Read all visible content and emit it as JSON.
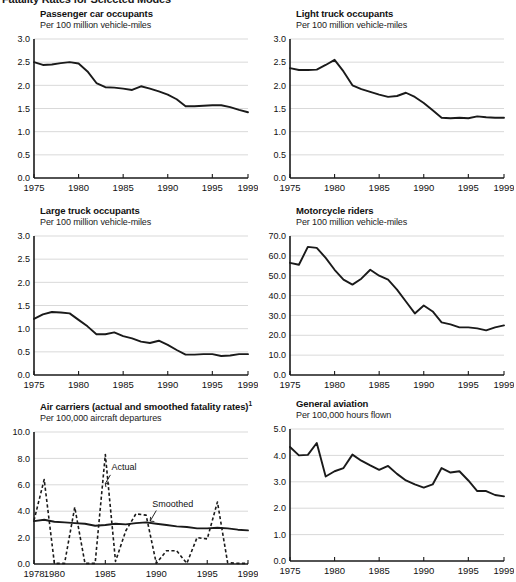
{
  "page": {
    "title": "Fatality Rates for Selected Modes"
  },
  "panels": [
    {
      "name": "passenger-car-occupants",
      "title": "Passenger car occupants",
      "subtitle": "Per 100 million vehicle-miles"
    },
    {
      "name": "light-truck-occupants",
      "title": "Light truck occupants",
      "subtitle": "Per 100 million vehicle-miles"
    },
    {
      "name": "large-truck-occupants",
      "title": "Large truck occupants",
      "subtitle": "Per 100 million vehicle-miles"
    },
    {
      "name": "motorcycle-riders",
      "title": "Motorcycle riders",
      "subtitle": "Per 100 million vehicle-miles"
    },
    {
      "name": "air-carriers",
      "title": "Air carriers (actual and smoothed fatality rates)",
      "title_sup": "1",
      "subtitle": "Per 100,000 aircraft departures"
    },
    {
      "name": "general-aviation",
      "title": "General aviation",
      "subtitle": "Per 100,000 hours flown"
    }
  ],
  "chart_data": [
    {
      "type": "line",
      "panel": "passenger-car-occupants",
      "title": "Passenger car occupants",
      "subtitle": "Per 100 million vehicle-miles",
      "xlabel": "",
      "ylabel": "Per 100 million vehicle-miles",
      "grid": true,
      "legend": "none",
      "xlim": [
        1975,
        1999
      ],
      "ylim": [
        0.0,
        3.0
      ],
      "yticks": [
        0.0,
        0.5,
        1.0,
        1.5,
        2.0,
        2.5,
        3.0
      ],
      "yticklabels": [
        "0.0",
        "0.5",
        "1.0",
        "1.5",
        "2.0",
        "2.5",
        "3.0"
      ],
      "xticks": [
        1975,
        1980,
        1985,
        1990,
        1995,
        1999
      ],
      "xticklabels": [
        "1975",
        "1980",
        "1985",
        "1990",
        "1995",
        "1999"
      ],
      "x": [
        1975,
        1976,
        1977,
        1978,
        1979,
        1980,
        1981,
        1982,
        1983,
        1984,
        1985,
        1986,
        1987,
        1988,
        1989,
        1990,
        1991,
        1992,
        1993,
        1994,
        1995,
        1996,
        1997,
        1998,
        1999
      ],
      "values": [
        2.5,
        2.44,
        2.45,
        2.48,
        2.5,
        2.47,
        2.3,
        2.05,
        1.96,
        1.95,
        1.93,
        1.9,
        1.98,
        1.93,
        1.87,
        1.8,
        1.7,
        1.55,
        1.55,
        1.56,
        1.57,
        1.57,
        1.53,
        1.47,
        1.42
      ]
    },
    {
      "type": "line",
      "panel": "light-truck-occupants",
      "title": "Light truck occupants",
      "subtitle": "Per 100 million vehicle-miles",
      "xlabel": "",
      "ylabel": "Per 100 million vehicle-miles",
      "grid": true,
      "legend": "none",
      "xlim": [
        1975,
        1999
      ],
      "ylim": [
        0.0,
        3.0
      ],
      "yticks": [
        0.0,
        0.5,
        1.0,
        1.5,
        2.0,
        2.5,
        3.0
      ],
      "yticklabels": [
        "0.0",
        "0.5",
        "1.0",
        "1.5",
        "2.0",
        "2.5",
        "3.0"
      ],
      "xticks": [
        1975,
        1980,
        1985,
        1990,
        1995,
        1999
      ],
      "xticklabels": [
        "1975",
        "1980",
        "1985",
        "1990",
        "1995",
        "1999"
      ],
      "x": [
        1975,
        1976,
        1977,
        1978,
        1979,
        1980,
        1981,
        1982,
        1983,
        1984,
        1985,
        1986,
        1987,
        1988,
        1989,
        1990,
        1991,
        1992,
        1993,
        1994,
        1995,
        1996,
        1997,
        1998,
        1999
      ],
      "values": [
        2.37,
        2.33,
        2.33,
        2.34,
        2.44,
        2.55,
        2.3,
        2.0,
        1.92,
        1.86,
        1.8,
        1.75,
        1.77,
        1.84,
        1.75,
        1.62,
        1.46,
        1.3,
        1.29,
        1.3,
        1.29,
        1.33,
        1.31,
        1.3,
        1.3
      ]
    },
    {
      "type": "line",
      "panel": "large-truck-occupants",
      "title": "Large truck occupants",
      "subtitle": "Per 100 million vehicle-miles",
      "xlabel": "",
      "ylabel": "Per 100 million vehicle-miles",
      "grid": true,
      "legend": "none",
      "xlim": [
        1975,
        1999
      ],
      "ylim": [
        0.0,
        3.0
      ],
      "yticks": [
        0.0,
        0.5,
        1.0,
        1.5,
        2.0,
        2.5,
        3.0
      ],
      "yticklabels": [
        "0.0",
        "0.5",
        "1.0",
        "1.5",
        "2.0",
        "2.5",
        "3.0"
      ],
      "xticks": [
        1975,
        1980,
        1985,
        1990,
        1995,
        1999
      ],
      "xticklabels": [
        "1975",
        "1980",
        "1985",
        "1990",
        "1995",
        "1999"
      ],
      "x": [
        1975,
        1976,
        1977,
        1978,
        1979,
        1980,
        1981,
        1982,
        1983,
        1984,
        1985,
        1986,
        1987,
        1988,
        1989,
        1990,
        1991,
        1992,
        1993,
        1994,
        1995,
        1996,
        1997,
        1998,
        1999
      ],
      "values": [
        1.21,
        1.31,
        1.36,
        1.35,
        1.33,
        1.19,
        1.05,
        0.88,
        0.88,
        0.92,
        0.84,
        0.79,
        0.72,
        0.69,
        0.74,
        0.65,
        0.54,
        0.44,
        0.44,
        0.45,
        0.45,
        0.41,
        0.42,
        0.45,
        0.45
      ]
    },
    {
      "type": "line",
      "panel": "motorcycle-riders",
      "title": "Motorcycle riders",
      "subtitle": "Per 100 million vehicle-miles",
      "xlabel": "",
      "ylabel": "Per 100 million vehicle-miles",
      "grid": true,
      "legend": "none",
      "xlim": [
        1975,
        1999
      ],
      "ylim": [
        0.0,
        70.0
      ],
      "yticks": [
        0.0,
        10.0,
        20.0,
        30.0,
        40.0,
        50.0,
        60.0,
        70.0
      ],
      "yticklabels": [
        "0.0",
        "10.0",
        "20.0",
        "30.0",
        "40.0",
        "50.0",
        "60.0",
        "70.0"
      ],
      "xticks": [
        1975,
        1980,
        1985,
        1990,
        1995,
        1999
      ],
      "xticklabels": [
        "1975",
        "1980",
        "1985",
        "1990",
        "1995",
        "1999"
      ],
      "x": [
        1975,
        1976,
        1977,
        1978,
        1979,
        1980,
        1981,
        1982,
        1983,
        1984,
        1985,
        1986,
        1987,
        1988,
        1989,
        1990,
        1991,
        1992,
        1993,
        1994,
        1995,
        1996,
        1997,
        1998,
        1999
      ],
      "values": [
        56.5,
        55.5,
        64.5,
        64.0,
        59.0,
        53.0,
        48.0,
        45.5,
        48.5,
        53.0,
        50.0,
        48.0,
        43.0,
        37.0,
        31.0,
        35.0,
        32.0,
        26.5,
        25.5,
        24.0,
        24.0,
        23.5,
        22.5,
        24.0,
        25.0
      ]
    },
    {
      "type": "line",
      "panel": "air-carriers",
      "title": "Air carriers (actual and smoothed fatality rates)1",
      "subtitle": "Per 100,000 aircraft departures",
      "xlabel": "",
      "ylabel": "Per 100,000 aircraft departures",
      "grid": true,
      "legend": "inline-annotations",
      "annotations": [
        "Actual",
        "Smoothed"
      ],
      "xlim": [
        1978,
        1999
      ],
      "ylim": [
        0.0,
        10.0
      ],
      "yticks": [
        0.0,
        2.0,
        4.0,
        6.0,
        8.0,
        10.0
      ],
      "yticklabels": [
        "0.0",
        "2.0",
        "4.0",
        "6.0",
        "8.0",
        "10.0"
      ],
      "xticks": [
        1978,
        1980,
        1985,
        1990,
        1995,
        1999
      ],
      "xticklabels": [
        "1978",
        "1980",
        "1985",
        "1990",
        "1995",
        "1999"
      ],
      "x": [
        1978,
        1979,
        1980,
        1981,
        1982,
        1983,
        1984,
        1985,
        1986,
        1987,
        1988,
        1989,
        1990,
        1991,
        1992,
        1993,
        1994,
        1995,
        1996,
        1997,
        1998,
        1999
      ],
      "series": [
        {
          "name": "Actual",
          "style": "dashed",
          "values": [
            3.3,
            6.4,
            0.05,
            0.05,
            4.3,
            0.05,
            0.05,
            8.3,
            0.2,
            2.5,
            3.8,
            3.7,
            0.05,
            1.0,
            1.0,
            0.05,
            2.0,
            1.9,
            4.7,
            0.1,
            0.05,
            0.05
          ]
        },
        {
          "name": "Smoothed",
          "style": "solid",
          "values": [
            3.25,
            3.35,
            3.2,
            3.15,
            3.1,
            3.05,
            2.9,
            2.95,
            3.05,
            3.0,
            3.1,
            3.15,
            3.05,
            2.95,
            2.85,
            2.8,
            2.7,
            2.7,
            2.75,
            2.7,
            2.6,
            2.55
          ]
        }
      ]
    },
    {
      "type": "line",
      "panel": "general-aviation",
      "title": "General aviation",
      "subtitle": "Per 100,000 hours flown",
      "xlabel": "",
      "ylabel": "Per 100,000 hours flown",
      "grid": true,
      "legend": "none",
      "xlim": [
        1975,
        1999
      ],
      "ylim": [
        0.0,
        5.0
      ],
      "yticks": [
        0.0,
        1.0,
        2.0,
        3.0,
        4.0,
        5.0
      ],
      "yticklabels": [
        "0.0",
        "1.0",
        "2.0",
        "3.0",
        "4.0",
        "5.0"
      ],
      "xticks": [
        1975,
        1980,
        1985,
        1990,
        1995,
        1999
      ],
      "xticklabels": [
        "1975",
        "1980",
        "1985",
        "1990",
        "1995",
        "1999"
      ],
      "x": [
        1975,
        1976,
        1977,
        1978,
        1979,
        1980,
        1981,
        1982,
        1983,
        1984,
        1985,
        1986,
        1987,
        1988,
        1989,
        1990,
        1991,
        1992,
        1993,
        1994,
        1995,
        1996,
        1997,
        1998,
        1999
      ],
      "values": [
        4.32,
        4.0,
        4.02,
        4.47,
        3.2,
        3.4,
        3.52,
        4.03,
        3.8,
        3.62,
        3.45,
        3.6,
        3.3,
        3.05,
        2.9,
        2.78,
        2.9,
        3.52,
        3.35,
        3.4,
        3.05,
        2.65,
        2.65,
        2.5,
        2.45
      ]
    }
  ]
}
